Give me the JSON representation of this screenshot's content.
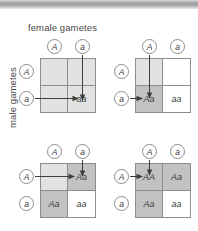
{
  "diagram": {
    "axis_labels": {
      "columns": "female gametes",
      "rows": "male gametes"
    },
    "alleles": {
      "dominant": "A",
      "recessive": "a"
    },
    "colors": {
      "shade_light": "#e2e2e2",
      "shade_dark": "#c2c2c2",
      "shade_none": "#ffffff",
      "grid_line": "#8d8d8d",
      "arrow": "#3d3d3d",
      "top_bar": "#9e9e9e"
    },
    "panels": [
      {
        "id": "panel-1",
        "position": "top-left",
        "column_gametes": [
          "A",
          "a"
        ],
        "row_gametes": [
          "A",
          "a"
        ],
        "cells": [
          {
            "genotype": "",
            "shade": "light"
          },
          {
            "genotype": "",
            "shade": "light"
          },
          {
            "genotype": "",
            "shade": "light"
          },
          {
            "genotype": "aa",
            "shade": "light"
          }
        ],
        "arrows": [
          {
            "from": "column-gamete-a",
            "to": "cell-4",
            "direction": "down"
          },
          {
            "from": "row-gamete-a",
            "to": "cell-4",
            "direction": "right"
          }
        ]
      },
      {
        "id": "panel-2",
        "position": "top-right",
        "column_gametes": [
          "A",
          "a"
        ],
        "row_gametes": [
          "A",
          "a"
        ],
        "cells": [
          {
            "genotype": "",
            "shade": "light"
          },
          {
            "genotype": "",
            "shade": "none"
          },
          {
            "genotype": "Aa",
            "shade": "dark"
          },
          {
            "genotype": "aa",
            "shade": "none"
          }
        ],
        "arrows": [
          {
            "from": "column-gamete-A",
            "to": "cell-3",
            "direction": "down"
          },
          {
            "from": "row-gamete-a",
            "to": "cell-3",
            "direction": "right"
          }
        ]
      },
      {
        "id": "panel-3",
        "position": "bottom-left",
        "column_gametes": [
          "A",
          "a"
        ],
        "row_gametes": [
          "A",
          "a"
        ],
        "cells": [
          {
            "genotype": "",
            "shade": "light"
          },
          {
            "genotype": "Aa",
            "shade": "dark"
          },
          {
            "genotype": "Aa",
            "shade": "dark"
          },
          {
            "genotype": "aa",
            "shade": "none"
          }
        ],
        "arrows": [
          {
            "from": "column-gamete-a",
            "to": "cell-2",
            "direction": "down"
          },
          {
            "from": "row-gamete-A",
            "to": "cell-2",
            "direction": "right"
          }
        ]
      },
      {
        "id": "panel-4",
        "position": "bottom-right",
        "column_gametes": [
          "A",
          "a"
        ],
        "row_gametes": [
          "A",
          "a"
        ],
        "cells": [
          {
            "genotype": "AA",
            "shade": "dark"
          },
          {
            "genotype": "Aa",
            "shade": "dark"
          },
          {
            "genotype": "Aa",
            "shade": "dark"
          },
          {
            "genotype": "aa",
            "shade": "none"
          }
        ],
        "arrows": [
          {
            "from": "column-gamete-A",
            "to": "cell-1",
            "direction": "down"
          },
          {
            "from": "row-gamete-A",
            "to": "cell-1",
            "direction": "right"
          }
        ]
      }
    ]
  }
}
